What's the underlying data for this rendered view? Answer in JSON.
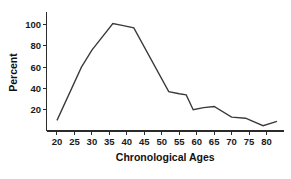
{
  "chart_data": {
    "type": "line",
    "title": "",
    "xlabel": "Chronological Ages",
    "ylabel": "Percent",
    "xlim": [
      17,
      85
    ],
    "ylim": [
      0,
      110
    ],
    "grid": false,
    "legend": null,
    "xticks": [
      20,
      25,
      30,
      35,
      40,
      45,
      50,
      55,
      60,
      65,
      70,
      75,
      80
    ],
    "xtick_labels": [
      "20",
      "25",
      "30",
      "35",
      "40",
      "45",
      "50",
      "55",
      "60",
      "65",
      "70",
      "75",
      "80"
    ],
    "yticks": [
      20,
      40,
      60,
      80,
      100
    ],
    "ytick_labels": [
      "20",
      "40",
      "60",
      "80",
      "100"
    ],
    "series": [
      {
        "name": "Percent",
        "color": "#3a3a3a",
        "x": [
          20,
          27,
          30,
          36,
          39,
          42,
          52,
          55,
          57,
          59,
          62,
          65,
          70,
          74,
          79,
          83
        ],
        "y": [
          10,
          60,
          76,
          101,
          99,
          97,
          37,
          35,
          34,
          20,
          22,
          23,
          13,
          12,
          5,
          9
        ]
      }
    ]
  },
  "figure": {
    "background_color": "#ffffff",
    "axis_color": "#2b2b2b",
    "line_color": "#3a3a3a"
  }
}
